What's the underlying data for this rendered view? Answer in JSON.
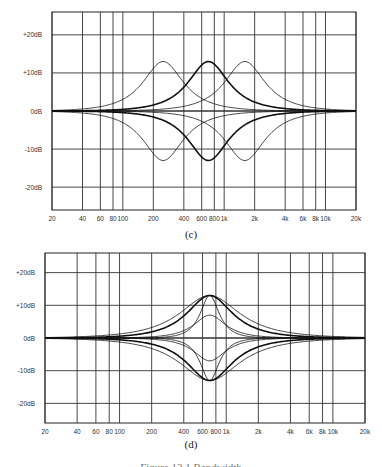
{
  "figure": {
    "caption_partial": "Figure 13.1  Bandwidth"
  },
  "chart_data": [
    {
      "id": "c",
      "type": "line",
      "caption": "(c)",
      "title": "",
      "xlabel": "",
      "ylabel": "",
      "x_scale": "log",
      "xlim": [
        20,
        20000
      ],
      "ylim": [
        -26,
        26
      ],
      "grid": true,
      "legend": "none",
      "x_ticks": [
        {
          "v": 20,
          "label": "20"
        },
        {
          "v": 40,
          "label": "40"
        },
        {
          "v": 60,
          "label": "60"
        },
        {
          "v": 80,
          "label": "80"
        },
        {
          "v": 100,
          "label": "100"
        },
        {
          "v": 200,
          "label": "200"
        },
        {
          "v": 400,
          "label": "400"
        },
        {
          "v": 600,
          "label": "600"
        },
        {
          "v": 800,
          "label": "800"
        },
        {
          "v": 1000,
          "label": "1k"
        },
        {
          "v": 2000,
          "label": "2k"
        },
        {
          "v": 4000,
          "label": "4k"
        },
        {
          "v": 6000,
          "label": "6k"
        },
        {
          "v": 8000,
          "label": "8k"
        },
        {
          "v": 10000,
          "label": "10k"
        },
        {
          "v": 20000,
          "label": "20k"
        }
      ],
      "y_ticks": [
        {
          "v": 20,
          "label": "+20dB"
        },
        {
          "v": 10,
          "label": "+10dB"
        },
        {
          "v": 0,
          "label": "0dB"
        },
        {
          "v": -10,
          "label": "-10dB"
        },
        {
          "v": -20,
          "label": "-20dB"
        }
      ],
      "series": [
        {
          "name": "boost 250 Hz",
          "center_hz": 250,
          "gain_db": 13,
          "width_oct": 1.35,
          "weight": 0.8
        },
        {
          "name": "boost 700 Hz",
          "center_hz": 700,
          "gain_db": 13,
          "width_oct": 1.35,
          "weight": 1.6
        },
        {
          "name": "boost 1.6 kHz",
          "center_hz": 1600,
          "gain_db": 13,
          "width_oct": 1.35,
          "weight": 0.8
        },
        {
          "name": "cut 250 Hz",
          "center_hz": 250,
          "gain_db": -13,
          "width_oct": 1.35,
          "weight": 0.8
        },
        {
          "name": "cut 700 Hz",
          "center_hz": 700,
          "gain_db": -13,
          "width_oct": 1.35,
          "weight": 1.6
        },
        {
          "name": "cut 1.6 kHz",
          "center_hz": 1600,
          "gain_db": -13,
          "width_oct": 1.35,
          "weight": 0.8
        }
      ],
      "box": {
        "left": 52,
        "top": 12,
        "right": 356,
        "bottom": 210
      }
    },
    {
      "id": "d",
      "type": "line",
      "caption": "(d)",
      "title": "",
      "xlabel": "",
      "ylabel": "",
      "x_scale": "log",
      "xlim": [
        20,
        20000
      ],
      "ylim": [
        -26,
        26
      ],
      "grid": true,
      "legend": "none",
      "x_ticks": [
        {
          "v": 20,
          "label": "20"
        },
        {
          "v": 40,
          "label": "40"
        },
        {
          "v": 60,
          "label": "60"
        },
        {
          "v": 80,
          "label": "80"
        },
        {
          "v": 100,
          "label": "100"
        },
        {
          "v": 200,
          "label": "200"
        },
        {
          "v": 400,
          "label": "400"
        },
        {
          "v": 600,
          "label": "600"
        },
        {
          "v": 800,
          "label": "800"
        },
        {
          "v": 1000,
          "label": "1k"
        },
        {
          "v": 2000,
          "label": "2k"
        },
        {
          "v": 4000,
          "label": "4k"
        },
        {
          "v": 6000,
          "label": "6k"
        },
        {
          "v": 8000,
          "label": "8k"
        },
        {
          "v": 10000,
          "label": "10k"
        },
        {
          "v": 20000,
          "label": "20k"
        }
      ],
      "y_ticks": [
        {
          "v": 20,
          "label": "+20dB"
        },
        {
          "v": 10,
          "label": "+10dB"
        },
        {
          "v": 0,
          "label": "0dB"
        },
        {
          "v": -10,
          "label": "-10dB"
        },
        {
          "v": -20,
          "label": "-20dB"
        }
      ],
      "series": [
        {
          "name": "boost wide",
          "center_hz": 700,
          "gain_db": 13,
          "width_oct": 1.9,
          "weight": 0.8
        },
        {
          "name": "boost medium",
          "center_hz": 700,
          "gain_db": 13,
          "width_oct": 1.45,
          "weight": 1.6
        },
        {
          "name": "boost narrow",
          "center_hz": 700,
          "gain_db": 13,
          "width_oct": 0.6,
          "weight": 0.8
        },
        {
          "name": "boost mild",
          "center_hz": 700,
          "gain_db": 7,
          "width_oct": 1.0,
          "weight": 0.8
        },
        {
          "name": "cut wide",
          "center_hz": 700,
          "gain_db": -13,
          "width_oct": 1.9,
          "weight": 0.8
        },
        {
          "name": "cut medium",
          "center_hz": 700,
          "gain_db": -13,
          "width_oct": 1.45,
          "weight": 1.6
        },
        {
          "name": "cut narrow",
          "center_hz": 700,
          "gain_db": -13,
          "width_oct": 0.6,
          "weight": 0.8
        },
        {
          "name": "cut mild",
          "center_hz": 700,
          "gain_db": -7,
          "width_oct": 1.0,
          "weight": 0.8
        }
      ],
      "box": {
        "left": 45,
        "top": 253,
        "right": 365,
        "bottom": 423
      }
    }
  ]
}
